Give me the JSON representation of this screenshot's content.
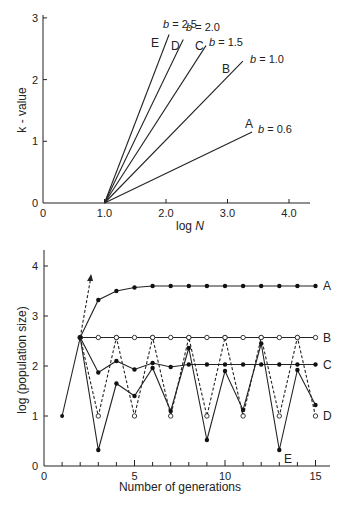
{
  "chart_data": [
    {
      "type": "line",
      "title": "",
      "xlabel": "log N",
      "ylabel": "k-value",
      "xlim": [
        0,
        4.2
      ],
      "ylim": [
        0,
        3
      ],
      "x_ticks": [
        "0",
        "1.0",
        "2.0",
        "3.0",
        "4.0"
      ],
      "y_ticks": [
        "0",
        "1",
        "2",
        "3"
      ],
      "grid": false,
      "series": [
        {
          "name": "A",
          "label": "b = 0.6",
          "b": 0.6,
          "x": [
            1.0,
            3.4
          ],
          "y": [
            0,
            1.15
          ]
        },
        {
          "name": "B",
          "label": "b = 1.0",
          "b": 1.0,
          "x": [
            1.0,
            3.25
          ],
          "y": [
            0,
            2.3
          ]
        },
        {
          "name": "C",
          "label": "b = 1.5",
          "b": 1.5,
          "x": [
            1.0,
            2.65
          ],
          "y": [
            0,
            2.55
          ]
        },
        {
          "name": "D",
          "label": "b = 2.0",
          "b": 2.0,
          "x": [
            1.0,
            2.28
          ],
          "y": [
            0,
            2.65
          ]
        },
        {
          "name": "E",
          "label": "b = 2.5",
          "b": 2.5,
          "x": [
            1.0,
            2.05
          ],
          "y": [
            0,
            2.73
          ]
        }
      ]
    },
    {
      "type": "line",
      "title": "",
      "xlabel": "Number of generations",
      "ylabel": "log (population size)",
      "xlim": [
        0,
        15.5
      ],
      "ylim": [
        0,
        4.3
      ],
      "x_ticks": [
        "0",
        "5",
        "10",
        "15"
      ],
      "y_ticks": [
        "0",
        "1",
        "2",
        "3",
        "4"
      ],
      "grid": false,
      "initial_point": {
        "x": 1,
        "y": 1.0
      },
      "exponential_arrow": {
        "x": [
          2,
          2.6
        ],
        "y": [
          2.57,
          3.8
        ],
        "style": "dashed"
      },
      "series": [
        {
          "name": "A",
          "marker": "filled",
          "style": "solid",
          "x": [
            2,
            3,
            4,
            5,
            6,
            7,
            8,
            9,
            10,
            11,
            12,
            13,
            14,
            15
          ],
          "y": [
            2.57,
            3.32,
            3.5,
            3.57,
            3.6,
            3.6,
            3.6,
            3.6,
            3.6,
            3.6,
            3.6,
            3.6,
            3.6,
            3.6
          ]
        },
        {
          "name": "B",
          "marker": "open",
          "style": "solid",
          "x": [
            2,
            3,
            4,
            5,
            6,
            7,
            8,
            9,
            10,
            11,
            12,
            13,
            14,
            15
          ],
          "y": [
            2.57,
            2.57,
            2.57,
            2.57,
            2.57,
            2.57,
            2.57,
            2.57,
            2.57,
            2.57,
            2.57,
            2.57,
            2.57,
            2.57
          ]
        },
        {
          "name": "C",
          "marker": "filled",
          "style": "solid",
          "x": [
            2,
            3,
            4,
            5,
            6,
            7,
            8,
            9,
            10,
            11,
            12,
            13,
            14,
            15
          ],
          "y": [
            2.57,
            1.87,
            2.1,
            1.93,
            2.06,
            1.98,
            2.03,
            2.03,
            2.03,
            2.03,
            2.03,
            2.03,
            2.03,
            2.03
          ]
        },
        {
          "name": "D",
          "marker": "open",
          "style": "dashed",
          "x": [
            2,
            3,
            4,
            5,
            6,
            7,
            8,
            9,
            10,
            11,
            12,
            13,
            14,
            15
          ],
          "y": [
            2.57,
            1.0,
            2.57,
            1.0,
            2.57,
            1.0,
            2.57,
            1.0,
            2.57,
            1.0,
            2.57,
            1.0,
            2.57,
            1.0
          ]
        },
        {
          "name": "E",
          "marker": "filled",
          "style": "solid",
          "x": [
            2,
            3,
            4,
            5,
            6,
            7,
            8,
            9,
            10,
            11,
            12,
            13,
            14,
            15
          ],
          "y": [
            2.57,
            0.32,
            1.65,
            1.4,
            1.96,
            1.1,
            2.36,
            0.52,
            1.9,
            1.12,
            2.45,
            0.32,
            1.92,
            1.22
          ]
        }
      ]
    }
  ],
  "top": {
    "ylabel": "k - value",
    "xlabel_main": "log ",
    "xlabel_italic": "N",
    "xticks": [
      "0",
      "1.0",
      "2.0",
      "3.0",
      "4.0"
    ],
    "yticks": [
      "0",
      "1",
      "2",
      "3"
    ],
    "curve_letters": [
      "A",
      "B",
      "C",
      "D",
      "E"
    ],
    "b_labels": [
      "b = 0.6",
      "b = 1.0",
      "b = 1.5",
      "b = 2.0",
      "b = 2.5"
    ]
  },
  "bottom": {
    "ylabel": "log (population size)",
    "xlabel": "Number of generations",
    "xticks": [
      "0",
      "5",
      "10",
      "15"
    ],
    "yticks": [
      "0",
      "1",
      "2",
      "3",
      "4"
    ],
    "series_letters": [
      "A",
      "B",
      "C",
      "D",
      "E"
    ]
  }
}
